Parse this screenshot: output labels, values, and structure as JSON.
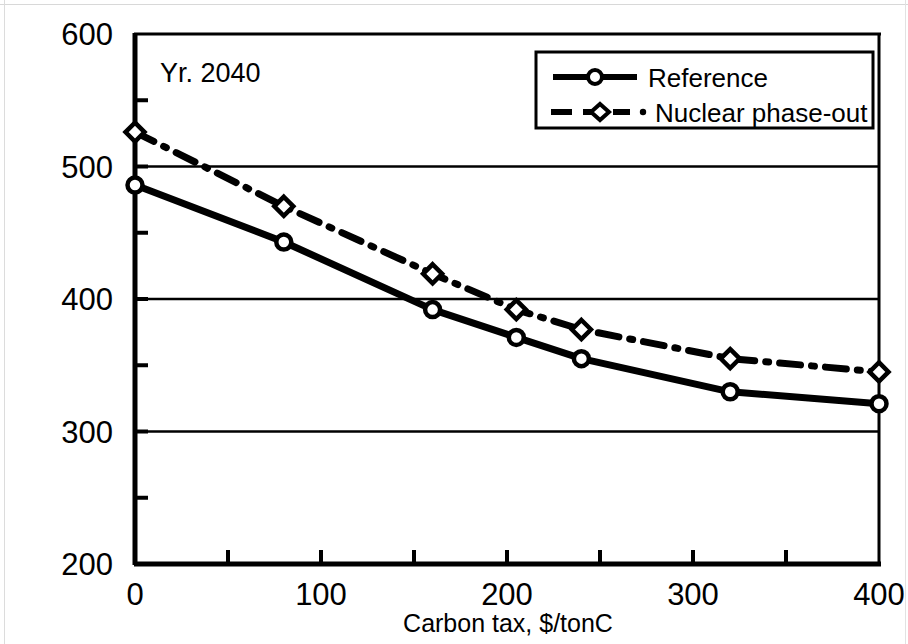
{
  "chart_data": {
    "type": "line",
    "title": "",
    "annotation": "Yr. 2040",
    "xlabel": "Carbon tax, $/tonC",
    "ylabel": "",
    "xlim": [
      0,
      400
    ],
    "ylim": [
      200,
      600
    ],
    "xticks": [
      0,
      100,
      200,
      300,
      400
    ],
    "xtick_labels": [
      "0",
      "100",
      "200",
      "300",
      "400"
    ],
    "xminor_ticks": [
      50,
      150,
      250,
      350
    ],
    "yticks": [
      200,
      300,
      400,
      500,
      600
    ],
    "ytick_labels": [
      "200",
      "300",
      "400",
      "500",
      "600"
    ],
    "yminor_ticks": [
      250,
      350,
      450,
      550
    ],
    "gridlines": [
      300,
      400,
      500
    ],
    "grid": true,
    "legend_position": "top-right",
    "series": [
      {
        "name": "Reference",
        "marker": "circle",
        "linestyle": "solid",
        "color": "#000000",
        "x": [
          0,
          80,
          160,
          205,
          240,
          320,
          400
        ],
        "values": [
          486,
          443,
          392,
          371,
          355,
          330,
          321
        ]
      },
      {
        "name": "Nuclear phase-out",
        "marker": "diamond",
        "linestyle": "dash-dot",
        "color": "#000000",
        "x": [
          0,
          80,
          160,
          205,
          240,
          320,
          400
        ],
        "values": [
          526,
          470,
          419,
          392,
          377,
          355,
          345
        ]
      }
    ]
  },
  "legend": {
    "entries": [
      {
        "label": "Reference"
      },
      {
        "label": "Nuclear phase-out"
      }
    ]
  },
  "axes": {
    "x_title": "Carbon tax, $/tonC"
  }
}
